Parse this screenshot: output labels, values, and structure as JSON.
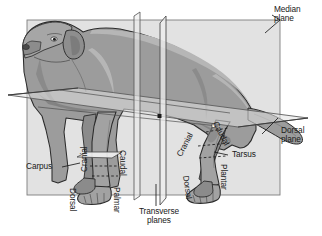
{
  "figure": {
    "type": "anatomical-planes-diagram"
  },
  "colors": {
    "plane_fill": "#e2e2e2",
    "plane_edge": "#6e6e6e",
    "body_fill": "#9c9c9c",
    "body_shadow": "#6d6d6d",
    "body_light": "#b8b8b8",
    "outline": "#2b2b2b",
    "text": "#1a1a1a",
    "background": "#ffffff"
  },
  "labels": {
    "median_plane": "Median\nplane",
    "median_plane_line1": "Median",
    "median_plane_line2": "plane",
    "dorsal_plane_line1": "Dorsal",
    "dorsal_plane_line2": "plane",
    "transverse_planes_line1": "Transverse",
    "transverse_planes_line2": "planes",
    "carpus": "Carpus",
    "tarsus": "Tarsus",
    "forelimb_cranial": "Cranial",
    "forelimb_caudal": "Caudal",
    "forelimb_dorsal": "Dorsal",
    "forelimb_palmar": "Palmar",
    "hindlimb_cranial": "Cranial",
    "hindlimb_caudal": "Caudal",
    "hindlimb_dorsal": "Dorsal",
    "hindlimb_plantar": "Plantar"
  }
}
